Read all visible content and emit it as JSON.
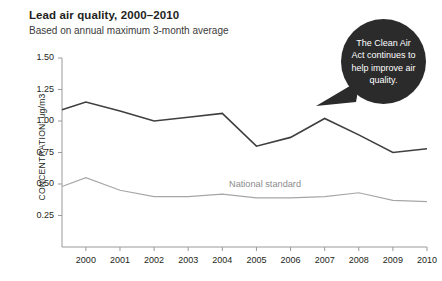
{
  "chart_data": {
    "type": "line",
    "title": "Lead air quality, 2000–2010",
    "subtitle": "Based on annual maximum 3-month average",
    "xlabel": "",
    "ylabel": "CONCENTRATION, ug/m3",
    "ylim": [
      0,
      1.5
    ],
    "xlim": [
      1999.3,
      2010
    ],
    "grid": false,
    "legend_position": "inline-annotation",
    "y_ticks": [
      "1.50",
      "1.25",
      "1.00",
      "0.75",
      "0.50",
      "0.25"
    ],
    "y_tick_values": [
      1.5,
      1.25,
      1.0,
      0.75,
      0.5,
      0.25
    ],
    "categories": [
      "1999.3",
      "2000",
      "2001",
      "2002",
      "2003",
      "2004",
      "2005",
      "2006",
      "2007",
      "2008",
      "2009",
      "2010"
    ],
    "x_tick_labels": [
      "2000",
      "2001",
      "2002",
      "2003",
      "2004",
      "2005",
      "2006",
      "2007",
      "2008",
      "2009",
      "2010"
    ],
    "x_tick_values": [
      2000,
      2001,
      2002,
      2003,
      2004,
      2005,
      2006,
      2007,
      2008,
      2009,
      2010
    ],
    "series": [
      {
        "name": "Lead concentration",
        "color": "#3f3f3f",
        "values": [
          1.09,
          1.15,
          1.08,
          1.0,
          1.03,
          1.06,
          0.8,
          0.87,
          1.02,
          0.89,
          0.75,
          0.78
        ]
      },
      {
        "name": "National standard",
        "color": "#a6a6a6",
        "values": [
          0.48,
          0.55,
          0.45,
          0.4,
          0.4,
          0.42,
          0.39,
          0.39,
          0.4,
          0.43,
          0.37,
          0.36
        ]
      }
    ],
    "annotations": [
      {
        "name": "national-standard-label",
        "text": "National standard",
        "color": "#8c8c8c"
      },
      {
        "name": "clean-air-act-callout",
        "text": "The Clean Air Act continues to help improve air quality.",
        "background": "#2b2b2b",
        "color": "#ffffff"
      }
    ],
    "axis_color": "#9a9a9a"
  },
  "colors": {
    "background": "#ffffff",
    "text": "#231f20",
    "series_primary": "#3f3f3f",
    "series_standard": "#a6a6a6",
    "callout_background": "#2b2b2b",
    "callout_text": "#ffffff",
    "axis": "#9a9a9a"
  }
}
